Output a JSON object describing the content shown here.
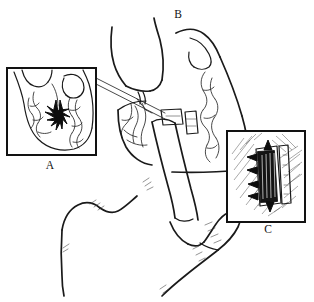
{
  "figure": {
    "background_color": "#ffffff",
    "ink_color": "#1a1a1a",
    "width": 314,
    "height": 302,
    "style": "black-and-white pen-and-ink medical illustration"
  },
  "panels": [
    {
      "id": "A",
      "label": "A",
      "label_x": 50,
      "label_y": 169,
      "frame": {
        "x": 7,
        "y": 68,
        "width": 89,
        "height": 87
      },
      "description": "Inset close-up of heart chamber interior with trabeculated wall and a dark starburst puncture site",
      "contents": "heart-chamber-cutaway-with-starburst-marker"
    },
    {
      "id": "B",
      "label": "B",
      "label_x": 178,
      "label_y": 18,
      "frame": null,
      "description": "Main overview drawing: torso and hand holding an applicator against the chest wall",
      "contents": "main-overview-hand-and-torso"
    },
    {
      "id": "C",
      "label": "C",
      "label_x": 268,
      "label_y": 233,
      "frame": {
        "x": 227,
        "y": 131,
        "width": 78,
        "height": 91
      },
      "description": "Inset close-up of the implanted closure device seated in hatched tissue, with arrows marking the edges",
      "contents": "closure-device-detail-with-hatching"
    }
  ],
  "annotations": {
    "leader_lines": [
      {
        "name": "panel-a-leader-upper",
        "from": "panel-A right edge",
        "to": "device site on main drawing"
      },
      {
        "name": "panel-a-leader-lower",
        "from": "panel-A right edge",
        "to": "device site on main drawing"
      }
    ],
    "arrows": [
      {
        "name": "device-top-arrow",
        "panel": "C",
        "direction": "down"
      },
      {
        "name": "device-bottom-arrow",
        "panel": "C",
        "direction": "up"
      },
      {
        "name": "device-left-arrows",
        "panel": "C",
        "direction": "right",
        "count": 4
      }
    ]
  },
  "colors": {
    "ink": "#1a1a1a",
    "frame": "#121212",
    "hatch": "#555555",
    "device": "#141414",
    "background": "#ffffff"
  }
}
